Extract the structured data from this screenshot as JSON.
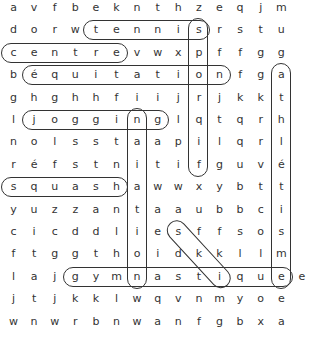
{
  "puzzle": {
    "rows": [
      "avfbeknthzeqjm ",
      "dorwtennisrstu ",
      "centrevwxpffgg ",
      "béquitationfga ",
      "ghghhfiijrjkkt ",
      "ljogginglqtqrh ",
      "nolsstaapilqrl ",
      "réfstnitifguvé ",
      "squashawwxybtt ",
      "yuzzantaaubbci ",
      "cicddliesffsos ",
      "ftggthoidkkllm ",
      "lajgymnastiquee",
      "jtjkklwqvnmyoe ",
      "wnwrbnwanfgbxa "
    ],
    "found_words": [
      {
        "word": "tennis",
        "direction": "horizontal",
        "row": 1,
        "start_col": 4,
        "end_col": 9
      },
      {
        "word": "centre",
        "direction": "horizontal",
        "row": 2,
        "start_col": 0,
        "end_col": 5
      },
      {
        "word": "équitation",
        "direction": "horizontal",
        "row": 3,
        "start_col": 1,
        "end_col": 10
      },
      {
        "word": "jogging",
        "direction": "horizontal",
        "row": 5,
        "start_col": 1,
        "end_col": 7
      },
      {
        "word": "squash",
        "direction": "horizontal",
        "row": 8,
        "start_col": 0,
        "end_col": 5
      },
      {
        "word": "gymnastique",
        "direction": "horizontal",
        "row": 12,
        "start_col": 3,
        "end_col": 13
      },
      {
        "word": "sport",
        "direction": "vertical",
        "col": 9,
        "start_row": 1,
        "end_row": 7
      },
      {
        "word": "natation",
        "direction": "vertical",
        "col": 6,
        "start_row": 5,
        "end_row": 12
      },
      {
        "word": "athlétisme",
        "direction": "vertical",
        "col": 13,
        "start_row": 3,
        "end_row": 12
      },
      {
        "word": "ski",
        "direction": "diagonal",
        "start_row": 10,
        "start_col": 8,
        "end_row": 12,
        "end_col": 10
      }
    ]
  }
}
